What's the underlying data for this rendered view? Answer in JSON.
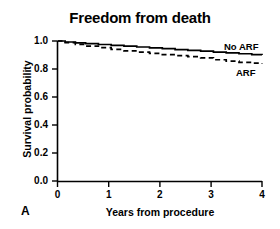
{
  "panel": {
    "letter": "A"
  },
  "chart_data": {
    "type": "line",
    "title": "Freedom from death",
    "xlabel": "Years from procedure",
    "ylabel": "Survival probability",
    "xlim": [
      0,
      4
    ],
    "ylim": [
      0.0,
      1.0
    ],
    "grid": false,
    "legend_position": "inline-right",
    "xticks": [
      "0",
      "1",
      "2",
      "3",
      "4"
    ],
    "xtick_values": [
      0,
      1,
      2,
      3,
      4
    ],
    "yticks": [
      "0.0",
      "0.2",
      "0.4",
      "0.6",
      "0.8",
      "1.0"
    ],
    "ytick_values": [
      0.0,
      0.2,
      0.4,
      0.6,
      0.8,
      1.0
    ],
    "series": [
      {
        "name": "No ARF",
        "style": "solid",
        "color": "#000000",
        "x": [
          0.0,
          0.15,
          0.35,
          0.55,
          0.8,
          1.05,
          1.3,
          1.55,
          1.8,
          2.05,
          2.3,
          2.55,
          2.8,
          3.05,
          3.3,
          3.55,
          3.8,
          4.0
        ],
        "values": [
          1.0,
          0.993,
          0.987,
          0.981,
          0.975,
          0.969,
          0.963,
          0.957,
          0.951,
          0.945,
          0.939,
          0.933,
          0.927,
          0.921,
          0.915,
          0.909,
          0.903,
          0.9
        ]
      },
      {
        "name": "ARF",
        "style": "dashed",
        "color": "#000000",
        "x": [
          0.0,
          0.15,
          0.35,
          0.55,
          0.8,
          1.05,
          1.3,
          1.55,
          1.8,
          2.05,
          2.3,
          2.55,
          2.8,
          3.05,
          3.3,
          3.55,
          3.8,
          4.0
        ],
        "values": [
          1.0,
          0.988,
          0.976,
          0.964,
          0.952,
          0.94,
          0.93,
          0.921,
          0.912,
          0.903,
          0.895,
          0.888,
          0.88,
          0.866,
          0.856,
          0.848,
          0.842,
          0.838
        ]
      }
    ],
    "annotations": [
      {
        "text": "No ARF",
        "series": "No ARF"
      },
      {
        "text": "ARF",
        "series": "ARF"
      }
    ]
  }
}
